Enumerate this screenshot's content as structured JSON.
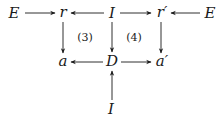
{
  "diagram": {
    "type": "commutative-diagram",
    "nodes": [
      {
        "id": "E1",
        "label": "E",
        "x": 14,
        "y": 13
      },
      {
        "id": "r",
        "label": "r",
        "x": 63,
        "y": 13
      },
      {
        "id": "I1",
        "label": "I",
        "x": 112,
        "y": 13
      },
      {
        "id": "r2",
        "label": "r′",
        "x": 161,
        "y": 13
      },
      {
        "id": "E2",
        "label": "E",
        "x": 210,
        "y": 13
      },
      {
        "id": "a",
        "label": "a",
        "x": 63,
        "y": 61
      },
      {
        "id": "D",
        "label": "D",
        "x": 112,
        "y": 61
      },
      {
        "id": "a2",
        "label": "a′",
        "x": 161,
        "y": 61
      },
      {
        "id": "I2",
        "label": "I",
        "x": 111,
        "y": 109
      }
    ],
    "edges": [
      {
        "from": "E1",
        "to": "r"
      },
      {
        "from": "I1",
        "to": "r"
      },
      {
        "from": "I1",
        "to": "r2"
      },
      {
        "from": "E2",
        "to": "r2"
      },
      {
        "from": "r",
        "to": "a"
      },
      {
        "from": "I1",
        "to": "D"
      },
      {
        "from": "r2",
        "to": "a2"
      },
      {
        "from": "D",
        "to": "a"
      },
      {
        "from": "D",
        "to": "a2"
      },
      {
        "from": "I2",
        "to": "D"
      }
    ],
    "region_labels": [
      {
        "id": "sq3",
        "label": "(3)",
        "x": 84,
        "y": 37
      },
      {
        "id": "sq4",
        "label": "(4)",
        "x": 134,
        "y": 37
      }
    ]
  }
}
